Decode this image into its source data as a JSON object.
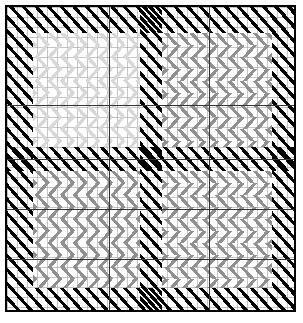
{
  "figure": {
    "title": "",
    "width": 303,
    "height": 323,
    "background": "#ffffff",
    "border_color": "#000000",
    "border_width": 2,
    "plot_box": {
      "x": 5,
      "y": 5,
      "width": 291,
      "height": 307
    }
  },
  "grid": {
    "minor": {
      "visible": true,
      "spacing_px": 10,
      "color": "#969696"
    },
    "major": {
      "visible": true,
      "color": "#333333",
      "vertical_x": [
        102,
        202
      ],
      "horizontal_y": [
        98,
        152,
        202,
        252
      ]
    }
  },
  "palette": {
    "black": "#000000",
    "dark_grey": "#4d4d4d",
    "medium_grey": "#909090",
    "light_grey": "#d8d8d8",
    "very_light_grey": "#e8e8e8",
    "white": "#ffffff",
    "grid_line": "#969696",
    "major_grid_line": "#333333"
  },
  "legend": {
    "visible": false,
    "entries": []
  },
  "axes": {
    "x_tick_labels": [],
    "y_tick_labels": [],
    "x_label": "",
    "y_label": ""
  },
  "chart_data": {
    "type": "heatmap",
    "title": "",
    "subtitle": "",
    "xlabel": "",
    "ylabel": "",
    "grid": true,
    "legend_position": "none",
    "xlim": [
      0,
      291
    ],
    "ylim": [
      0,
      307
    ],
    "categories_x": [
      "col-1",
      "col-2",
      "col-3"
    ],
    "categories_y": [
      "row-1",
      "row-2",
      "row-3",
      "row-4",
      "row-5"
    ],
    "fill_codes": {
      "0": "black-diagonal-hatch",
      "1": "light-grey-chevron",
      "2": "medium-grey-chevron"
    },
    "values": [
      [
        0,
        0,
        0
      ],
      [
        0,
        1,
        2
      ],
      [
        0,
        1,
        2
      ],
      [
        0,
        2,
        2
      ],
      [
        0,
        2,
        2
      ]
    ],
    "regions": [
      {
        "name": "border-band-top",
        "fill": 0,
        "x": 0,
        "y": 0,
        "w": 291,
        "h": 26
      },
      {
        "name": "border-band-left",
        "fill": 0,
        "x": 0,
        "y": 0,
        "w": 26,
        "h": 307
      },
      {
        "name": "border-band-right",
        "fill": 0,
        "x": 265,
        "y": 0,
        "w": 26,
        "h": 307
      },
      {
        "name": "border-band-bottom",
        "fill": 0,
        "x": 0,
        "y": 281,
        "w": 291,
        "h": 26
      },
      {
        "name": "center-band-vertical",
        "fill": 0,
        "x": 133,
        "y": 0,
        "w": 22,
        "h": 307
      },
      {
        "name": "mid-band-horizontal",
        "fill": 0,
        "x": 0,
        "y": 140,
        "w": 291,
        "h": 24
      },
      {
        "name": "block-top-left",
        "fill": 1,
        "x": 26,
        "y": 26,
        "w": 107,
        "h": 114
      },
      {
        "name": "block-top-right",
        "fill": 2,
        "x": 155,
        "y": 26,
        "w": 110,
        "h": 114
      },
      {
        "name": "block-bottom-left",
        "fill": 2,
        "x": 26,
        "y": 164,
        "w": 107,
        "h": 117
      },
      {
        "name": "block-bottom-right",
        "fill": 2,
        "x": 155,
        "y": 164,
        "w": 110,
        "h": 117
      }
    ]
  }
}
